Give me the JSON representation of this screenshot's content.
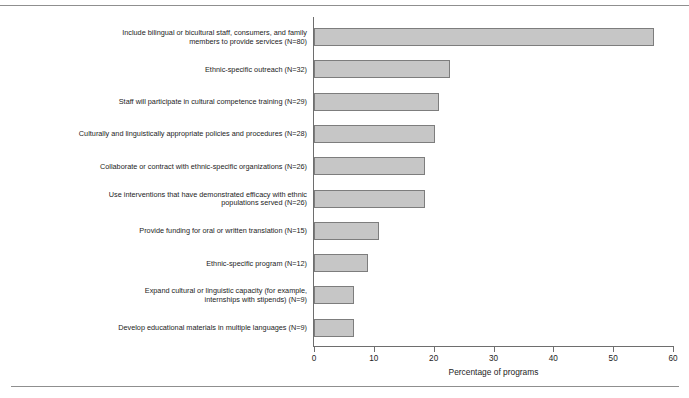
{
  "figure": {
    "header_fragment": "",
    "rules_visible": true
  },
  "chart_data": {
    "type": "bar",
    "orientation": "horizontal",
    "title": "",
    "xlabel": "Percentage of programs",
    "ylabel": "",
    "xlim": [
      0,
      60
    ],
    "xticks": [
      0,
      10,
      20,
      30,
      40,
      50,
      60
    ],
    "xtick_labels": [
      "0",
      "10",
      "20",
      "30",
      "40",
      "50",
      "60"
    ],
    "grid": false,
    "legend": null,
    "bar_color": "#c6c6c6",
    "bar_edge_color": "#7d7d7d",
    "categories": [
      "Include bilingual or bicultural staff, consumers, and family\nmembers to provide services (N=80)",
      "Ethnic-specific outreach (N=32)",
      "Staff will participate in cultural competence training (N=29)",
      "Culturally and linguistically appropriate policies and procedures (N=28)",
      "Collaborate or contract with ethnic-specific organizations (N=26)",
      "Use interventions that have demonstrated efficacy with ethnic\npopulations served (N=26)",
      "Provide funding for oral or written translation (N=15)",
      "Ethnic-specific program (N=12)",
      "Expand cultural or linguistic capacity (for example,\ninternships with stipends) (N=9)",
      "Develop educational materials in multiple languages (N=9)"
    ],
    "values": [
      56.9,
      22.7,
      20.9,
      20.2,
      18.6,
      18.6,
      10.9,
      9.0,
      6.7,
      6.7
    ],
    "counts": [
      80,
      32,
      29,
      28,
      26,
      26,
      15,
      12,
      9,
      9
    ]
  }
}
